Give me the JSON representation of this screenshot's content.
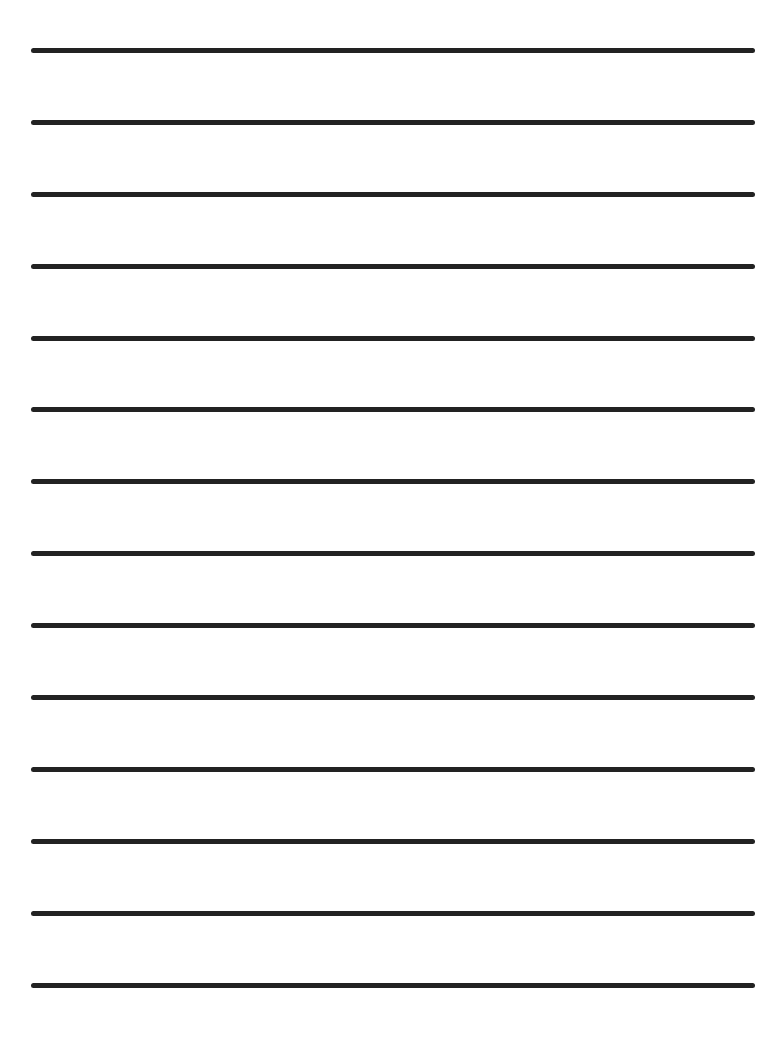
{
  "page": {
    "type": "lined-paper",
    "background_color": "#ffffff",
    "line_color": "#222222",
    "line_count": 14,
    "lines_y": [
      50,
      122,
      194,
      266,
      338,
      409,
      481,
      553,
      625,
      697,
      769,
      841,
      913,
      985
    ]
  }
}
